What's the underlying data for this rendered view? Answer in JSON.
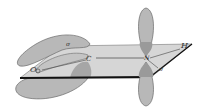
{
  "diagram": {
    "colors": {
      "lobe_fill": "#b8b8b8",
      "lobe_stroke": "#6a6a6a",
      "plane_fill": "#d6d6d6",
      "plane_edge": "#111111",
      "overlap_fill": "#999999"
    },
    "labels": {
      "sigma_top": "σ",
      "oxygen": "O",
      "carbon": "C",
      "nitrogen": "N",
      "hydrogen": "H",
      "sigma_n": "σ"
    }
  }
}
